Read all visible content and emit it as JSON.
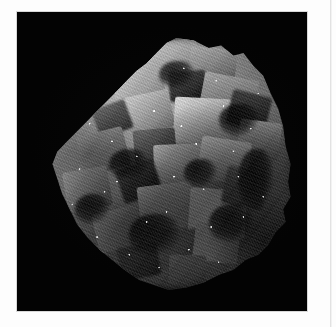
{
  "page": {
    "background_color": "#fdfdfd",
    "margin_rule_color": "#e2e2e2"
  },
  "figure": {
    "plate_background_color": "#030303",
    "plate_x": 17,
    "plate_y": 12,
    "plate_width": 290,
    "plate_height": 299,
    "alt": "Photograph of a grayscale mineral specimen against a black background"
  },
  "specimen": {
    "description": "Druzy crystal-coated mineral specimen with interlocking cubic crystal faces",
    "silhouette": "rounded triangular mass, apex upper-centre, widest across the middle",
    "surface": "granular druse / micro-crystalline sparkle coating",
    "highlight_color": "#d8d8d8",
    "midtone_color": "#8d8d8d",
    "shadow_color": "#2a2a2a",
    "lighting": "upper-left key light, deep shadows lower-right"
  }
}
